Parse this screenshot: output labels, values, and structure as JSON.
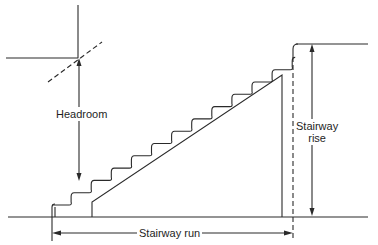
{
  "diagram": {
    "labels": {
      "headroom": "Headroom",
      "rise_line1": "Stairway",
      "rise_line2": "rise",
      "run": "Stairway run"
    },
    "colors": {
      "line": "#2a2a2a",
      "text": "#1e1e1e",
      "background": "#ffffff"
    },
    "geometry": {
      "ground_y": 217,
      "ground_x": [
        8,
        368
      ],
      "upper_floor_y": 44,
      "upper_floor_x": [
        296,
        368
      ],
      "ceiling_y": 58,
      "ceiling_x": [
        6,
        78
      ],
      "wall_x": 78,
      "wall_top_y": 5,
      "stair": {
        "start_x": 52,
        "start_y": 205,
        "steps": 12,
        "tread": 20.1,
        "riser": 12.3
      },
      "stringer": [
        [
          92,
          217
        ],
        [
          92,
          202
        ],
        [
          282,
          75
        ],
        [
          282,
          217
        ]
      ],
      "headroom_dash": [
        [
          48,
          82
        ],
        [
          102,
          42
        ]
      ],
      "headroom_arrow_x": 79,
      "headroom_arrow_y": [
        58,
        181
      ],
      "rise_arrow_x": 312,
      "rise_arrow_y": [
        44,
        216
      ],
      "landing_dash_x": 293,
      "landing_dash_y": [
        57,
        240
      ],
      "run_arrow_y": 233,
      "run_arrow_x": [
        52,
        293
      ]
    }
  }
}
